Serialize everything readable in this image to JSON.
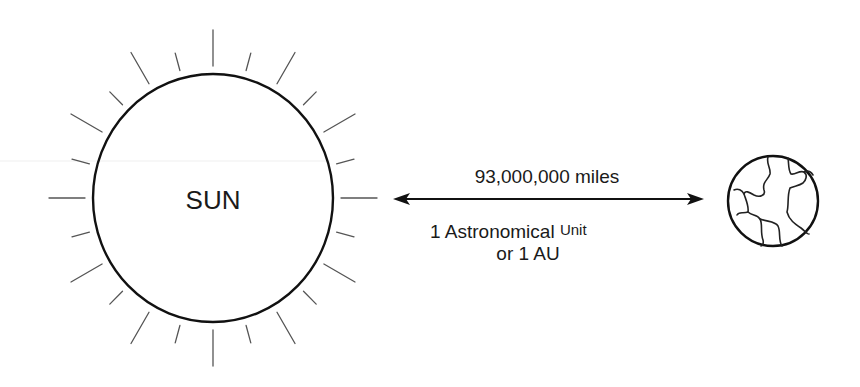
{
  "diagram": {
    "sun": {
      "label": "SUN",
      "center": [
        213,
        198
      ],
      "radius_x": 120,
      "radius_y": 124,
      "ray_count": 24
    },
    "earth": {
      "center": [
        773,
        201
      ],
      "radius": 45
    },
    "distance_arrow": {
      "from_x": 393,
      "to_x": 704,
      "y": 199,
      "label_top": "93,000,000 miles",
      "label_bottom_line1_main": "1 Astronomical",
      "label_bottom_line1_small": "Unit",
      "label_bottom_line2": "or 1 AU"
    },
    "colors": {
      "stroke": "#111111",
      "ray": "#555555",
      "background": "#ffffff",
      "faint_line": "#eeeeee"
    }
  }
}
